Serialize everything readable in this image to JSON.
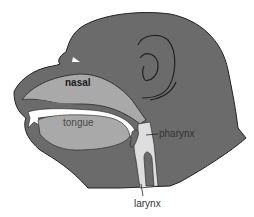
{
  "diagram": {
    "colors": {
      "head": "#6b6b6b",
      "cavity": "#a9a9a9",
      "airway": "#dedede",
      "outline": "#222222",
      "background": "#ffffff"
    },
    "labels": {
      "nasal": "nasal",
      "tongue": "tongue",
      "pharynx": "pharynx",
      "larynx": "larynx"
    }
  }
}
